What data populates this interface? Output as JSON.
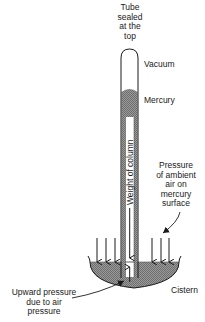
{
  "diagram": {
    "labels": {
      "tube_top": [
        "Tube",
        "sealed",
        "at the",
        "top"
      ],
      "vacuum": "Vacuum",
      "mercury": "Mercury",
      "weight_of_column": "Weight of column",
      "ambient_pressure": [
        "Pressure",
        "of ambient",
        "air on",
        "mercury",
        "surface"
      ],
      "upward_pressure": [
        "Upward pressure",
        "due to air",
        "pressure"
      ],
      "cistern": "Cistern"
    },
    "colors": {
      "ink": "#1a1a1a",
      "mercury_fill": "#8a8a8a",
      "background": "#ffffff"
    }
  }
}
